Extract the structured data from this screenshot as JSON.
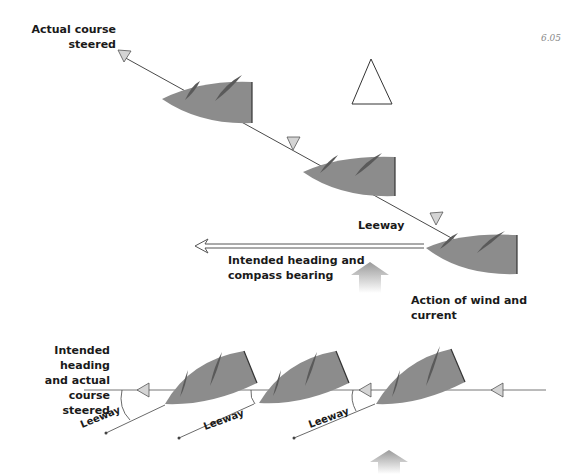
{
  "figure_number": "6.05",
  "top_diagram": {
    "label_actual_course": [
      "Actual course",
      "steered"
    ],
    "label_leeway": "Leeway",
    "label_intended_heading": [
      "Intended heading and",
      "compass bearing"
    ],
    "label_action": [
      "Action of wind and",
      "current"
    ]
  },
  "bottom_diagram": {
    "label_intended_actual": [
      "Intended heading",
      "and actual course",
      "steered"
    ],
    "leeway_labels": [
      "Leeway",
      "Leeway",
      "Leeway"
    ]
  },
  "colors": {
    "hull": "#8c8c8c",
    "sail": "#5a5a5a",
    "line": "#4a4a4a",
    "arrowhead_fill": "#d4d4d4",
    "wind_arrow": "#a8a8a8"
  }
}
